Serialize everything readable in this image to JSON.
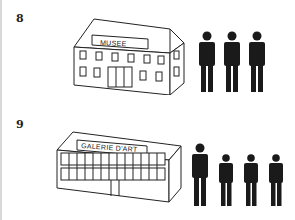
{
  "items": [
    {
      "number": "8",
      "building": {
        "type": "museum",
        "sign": "MUSEE"
      },
      "people": {
        "count": 3,
        "sizes": [
          "tall",
          "tall",
          "tall"
        ]
      }
    },
    {
      "number": "9",
      "building": {
        "type": "art-gallery",
        "sign": "GALERIE D'ART"
      },
      "people": {
        "count": 4,
        "sizes": [
          "tall",
          "short",
          "short",
          "short"
        ]
      }
    }
  ],
  "colors": {
    "ink": "#1a1a1a",
    "background": "#ffffff"
  }
}
